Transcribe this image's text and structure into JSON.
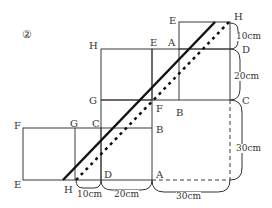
{
  "figure": {
    "number": "②",
    "line_color": "#3a3a3a",
    "diagonal_color": "#111111"
  },
  "labels": {
    "top_E": "E",
    "top_H": "H",
    "mid_H": "H",
    "mid_E": "E",
    "mid_A": "A",
    "right_D": "D",
    "mid_G": "G",
    "mid_F": "F",
    "mid_B_right": "B",
    "right_C": "C",
    "left_F": "F",
    "left_G": "G",
    "left_C": "C",
    "left_B": "B",
    "bottom_E": "E",
    "bottom_H": "H",
    "bottom_D": "D",
    "bottom_A": "A"
  },
  "dimensions": {
    "right_top": "10cm",
    "right_middle": "20cm",
    "right_bottom": "30cm",
    "bottom_left": "10cm",
    "bottom_middle": "20cm",
    "bottom_right": "30cm"
  }
}
